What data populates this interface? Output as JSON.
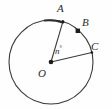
{
  "figure": {
    "kind": "circle-central-angle-diagram",
    "background_color": "#fefefe",
    "stroke_color": "#3a3a3a",
    "labels": {
      "center": "O",
      "point_a": "A",
      "point_b": "B",
      "point_c": "C",
      "angle": "n",
      "degree_symbol": "°"
    },
    "geometry": {
      "center_x": 51,
      "center_y": 62,
      "radius": 42,
      "point_a_angle_deg": 75,
      "point_b_angle_deg": 42,
      "point_c_angle_deg": 13,
      "arc_highlight_from_deg": 75,
      "arc_highlight_to_deg": 100
    }
  }
}
